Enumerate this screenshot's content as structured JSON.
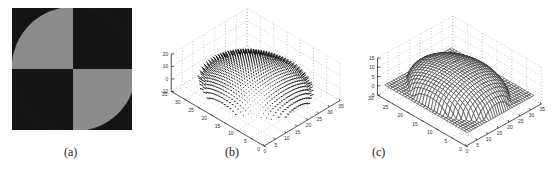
{
  "figure": {
    "panels": [
      {
        "id": "a",
        "caption": "(a)",
        "type": "image",
        "description": "Binary quadrant pattern: grey quarter-disc in top-left and bottom-right quadrants, black elsewhere",
        "colors": {
          "dark": "#141414",
          "light": "#8c8c8c"
        }
      },
      {
        "id": "b",
        "caption": "(b)",
        "type": "3d-quiver",
        "description": "Needle map of surface normals over a dome"
      },
      {
        "id": "c",
        "caption": "(c)",
        "type": "3d-mesh",
        "description": "Reconstructed dome surface mesh"
      }
    ]
  },
  "chart_data": [
    {
      "type": "heatmap",
      "panel": "a",
      "title": "",
      "caption": "(a)",
      "quadrants": {
        "top_left": "grey disc segment",
        "top_right": "black",
        "bottom_left": "black",
        "bottom_right": "grey disc segment"
      }
    },
    {
      "type": "scatter",
      "panel": "b",
      "caption": "(b)",
      "plot_kind": "3D quiver (needle map)",
      "z_ticks": [
        "-10",
        "0",
        "10",
        "20"
      ],
      "zlim": [
        -10,
        20
      ],
      "y_ticks": [
        "0",
        "5",
        "10",
        "15",
        "20",
        "25",
        "30",
        "35"
      ],
      "ylim": [
        0,
        35
      ],
      "x_ticks": [
        "0",
        "5",
        "10",
        "15",
        "20",
        "25",
        "30",
        "35"
      ],
      "xlim": [
        0,
        35
      ],
      "grid": true
    },
    {
      "type": "area",
      "panel": "c",
      "caption": "(c)",
      "plot_kind": "3D mesh surface",
      "z_ticks": [
        "-5",
        "0",
        "5",
        "10",
        "15"
      ],
      "zlim": [
        -5,
        15
      ],
      "y_ticks": [
        "0",
        "5",
        "10",
        "15",
        "20",
        "25",
        "30"
      ],
      "ylim": [
        0,
        30
      ],
      "x_ticks": [
        "0",
        "5",
        "10",
        "15",
        "20",
        "25",
        "30",
        "35"
      ],
      "xlim": [
        0,
        35
      ],
      "grid": true
    }
  ]
}
